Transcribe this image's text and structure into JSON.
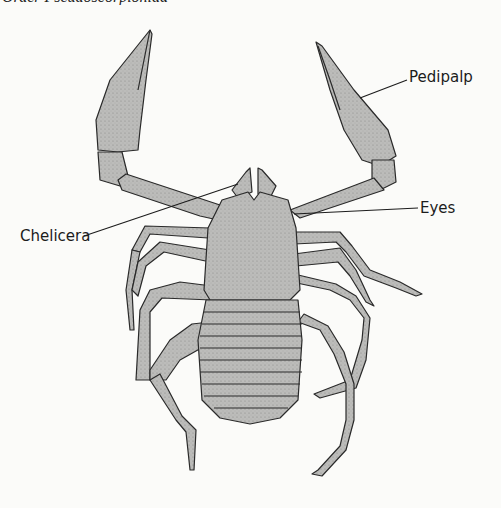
{
  "figure": {
    "caption_clipped": "Order Pseudoscorpionida",
    "colors": {
      "background": "#fbfbf9",
      "body_fill": "#b8b8b6",
      "outline": "#2a2a2a",
      "leader_line": "#1c1c1c"
    }
  },
  "labels": [
    {
      "id": "pedipalp",
      "text": "Pedipalp",
      "x": 409,
      "y": 77
    },
    {
      "id": "eyes",
      "text": "Eyes",
      "x": 420,
      "y": 203
    },
    {
      "id": "chelicera",
      "text": "Chelicera",
      "x": 20,
      "y": 230
    }
  ]
}
